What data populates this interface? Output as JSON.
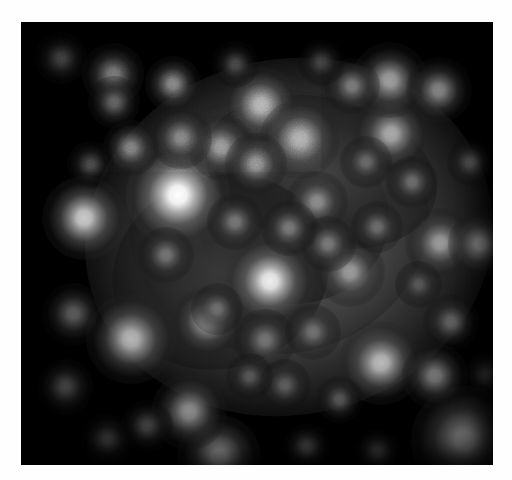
{
  "canvas": {
    "width": 512,
    "height": 480,
    "background_color": "#fefefe"
  },
  "frame": {
    "x": 21,
    "y": 22,
    "width": 472,
    "height": 443,
    "background_color": "#000000",
    "border_color": "#000000"
  },
  "image": {
    "kind": "astronomical-grayscale-image",
    "subject": "star-cluster",
    "colormode": "grayscale",
    "noise_opacity": 0.33
  },
  "chart_data": {
    "type": "scatter",
    "title": "",
    "xlabel": "",
    "ylabel": "",
    "xlim": [
      0,
      472
    ],
    "ylim": [
      0,
      443
    ],
    "grid": false,
    "legend": false,
    "halo": [
      {
        "cx": 268,
        "cy": 215,
        "rx": 205,
        "ry": 178,
        "peak": 0.56,
        "rotate": -12
      },
      {
        "cx": 258,
        "cy": 200,
        "rx": 150,
        "ry": 132,
        "peak": 0.42,
        "rotate": -8
      },
      {
        "cx": 272,
        "cy": 196,
        "rx": 96,
        "ry": 86,
        "peak": 0.3,
        "rotate": 0
      },
      {
        "cx": 300,
        "cy": 150,
        "rx": 118,
        "ry": 74,
        "peak": 0.26,
        "rotate": 14
      },
      {
        "cx": 200,
        "cy": 250,
        "rx": 110,
        "ry": 96,
        "peak": 0.22,
        "rotate": -20
      }
    ],
    "stars": [
      {
        "cx": 157,
        "cy": 173,
        "r": 22,
        "peak": 1.0
      },
      {
        "cx": 249,
        "cy": 259,
        "r": 19,
        "peak": 0.92
      },
      {
        "cx": 444,
        "cy": 418,
        "r": 23,
        "peak": 0.8
      },
      {
        "cx": 63,
        "cy": 196,
        "r": 18,
        "peak": 0.78
      },
      {
        "cx": 198,
        "cy": 435,
        "r": 18,
        "peak": 0.74
      },
      {
        "cx": 360,
        "cy": 341,
        "r": 18,
        "peak": 0.72
      },
      {
        "cx": 110,
        "cy": 317,
        "r": 19,
        "peak": 0.7
      },
      {
        "cx": 240,
        "cy": 83,
        "r": 16,
        "peak": 0.7
      },
      {
        "cx": 279,
        "cy": 117,
        "r": 17,
        "peak": 0.68
      },
      {
        "cx": 370,
        "cy": 112,
        "r": 16,
        "peak": 0.66
      },
      {
        "cx": 186,
        "cy": 300,
        "r": 15,
        "peak": 0.64
      },
      {
        "cx": 369,
        "cy": 58,
        "r": 16,
        "peak": 0.62
      },
      {
        "cx": 168,
        "cy": 390,
        "r": 16,
        "peak": 0.62
      },
      {
        "cx": 419,
        "cy": 221,
        "r": 15,
        "peak": 0.6
      },
      {
        "cx": 329,
        "cy": 250,
        "r": 15,
        "peak": 0.6
      },
      {
        "cx": 418,
        "cy": 68,
        "r": 14,
        "peak": 0.58
      },
      {
        "cx": 200,
        "cy": 125,
        "r": 14,
        "peak": 0.58
      },
      {
        "cx": 235,
        "cy": 142,
        "r": 13,
        "peak": 0.56
      },
      {
        "cx": 296,
        "cy": 180,
        "r": 13,
        "peak": 0.55
      },
      {
        "cx": 414,
        "cy": 354,
        "r": 14,
        "peak": 0.55
      },
      {
        "cx": 460,
        "cy": 222,
        "r": 14,
        "peak": 0.54
      },
      {
        "cx": 92,
        "cy": 52,
        "r": 13,
        "peak": 0.52
      },
      {
        "cx": 152,
        "cy": 62,
        "r": 12,
        "peak": 0.5
      },
      {
        "cx": 160,
        "cy": 116,
        "r": 13,
        "peak": 0.5
      },
      {
        "cx": 110,
        "cy": 126,
        "r": 12,
        "peak": 0.48
      },
      {
        "cx": 331,
        "cy": 64,
        "r": 12,
        "peak": 0.48
      },
      {
        "cx": 307,
        "cy": 222,
        "r": 12,
        "peak": 0.47
      },
      {
        "cx": 268,
        "cy": 206,
        "r": 12,
        "peak": 0.47
      },
      {
        "cx": 214,
        "cy": 200,
        "r": 12,
        "peak": 0.46
      },
      {
        "cx": 145,
        "cy": 233,
        "r": 12,
        "peak": 0.45
      },
      {
        "cx": 244,
        "cy": 318,
        "r": 13,
        "peak": 0.45
      },
      {
        "cx": 292,
        "cy": 310,
        "r": 12,
        "peak": 0.44
      },
      {
        "cx": 196,
        "cy": 287,
        "r": 11,
        "peak": 0.43
      },
      {
        "cx": 356,
        "cy": 205,
        "r": 11,
        "peak": 0.42
      },
      {
        "cx": 391,
        "cy": 160,
        "r": 11,
        "peak": 0.42
      },
      {
        "cx": 345,
        "cy": 140,
        "r": 11,
        "peak": 0.41
      },
      {
        "cx": 430,
        "cy": 300,
        "r": 12,
        "peak": 0.4
      },
      {
        "cx": 52,
        "cy": 292,
        "r": 13,
        "peak": 0.4
      },
      {
        "cx": 44,
        "cy": 365,
        "r": 12,
        "peak": 0.38
      },
      {
        "cx": 93,
        "cy": 80,
        "r": 11,
        "peak": 0.38
      },
      {
        "cx": 40,
        "cy": 36,
        "r": 11,
        "peak": 0.36
      },
      {
        "cx": 264,
        "cy": 363,
        "r": 11,
        "peak": 0.36
      },
      {
        "cx": 318,
        "cy": 377,
        "r": 10,
        "peak": 0.35
      },
      {
        "cx": 228,
        "cy": 354,
        "r": 10,
        "peak": 0.34
      },
      {
        "cx": 397,
        "cy": 262,
        "r": 10,
        "peak": 0.34
      },
      {
        "cx": 126,
        "cy": 404,
        "r": 11,
        "peak": 0.33
      },
      {
        "cx": 86,
        "cy": 418,
        "r": 11,
        "peak": 0.32
      },
      {
        "cx": 449,
        "cy": 140,
        "r": 10,
        "peak": 0.32
      },
      {
        "cx": 285,
        "cy": 425,
        "r": 10,
        "peak": 0.3
      },
      {
        "cx": 356,
        "cy": 430,
        "r": 10,
        "peak": 0.28
      },
      {
        "cx": 466,
        "cy": 352,
        "r": 10,
        "peak": 0.28
      },
      {
        "cx": 69,
        "cy": 142,
        "r": 10,
        "peak": 0.27
      },
      {
        "cx": 214,
        "cy": 42,
        "r": 10,
        "peak": 0.26
      },
      {
        "cx": 300,
        "cy": 40,
        "r": 10,
        "peak": 0.25
      }
    ]
  }
}
